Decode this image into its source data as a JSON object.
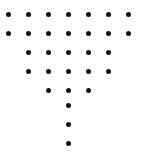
{
  "figure": {
    "background_color": "#ffffff",
    "dot_color": "#111111",
    "dot_diameter": 5,
    "width": 142,
    "height": 158
  },
  "grid": {
    "origin_x": 8,
    "origin_y": 14,
    "column_spacing": 20,
    "row_spacing": 19,
    "columns": 7,
    "rows": 8
  },
  "chart_data": {
    "type": "scatter",
    "title": "",
    "xlabel": "",
    "ylabel": "",
    "grid": false,
    "legend": "none",
    "xlim": [
      0,
      142
    ],
    "ylim": [
      0,
      158
    ],
    "total_dots": 27,
    "row_counts": [
      7,
      7,
      5,
      5,
      3,
      1,
      1,
      1
    ],
    "rows": [
      {
        "row": 1,
        "y": 14,
        "count": 7,
        "columns": [
          0,
          1,
          2,
          3,
          4,
          5,
          6
        ],
        "x": [
          8,
          28,
          48,
          68,
          88,
          108,
          128
        ]
      },
      {
        "row": 2,
        "y": 33,
        "count": 7,
        "columns": [
          0,
          1,
          2,
          3,
          4,
          5,
          6
        ],
        "x": [
          8,
          28,
          48,
          68,
          88,
          108,
          128
        ]
      },
      {
        "row": 3,
        "y": 52,
        "count": 5,
        "columns": [
          1,
          2,
          3,
          4,
          5
        ],
        "x": [
          28,
          48,
          68,
          88,
          108
        ]
      },
      {
        "row": 4,
        "y": 71,
        "count": 5,
        "columns": [
          1,
          2,
          3,
          4,
          5
        ],
        "x": [
          28,
          48,
          68,
          88,
          108
        ]
      },
      {
        "row": 5,
        "y": 90,
        "count": 3,
        "columns": [
          2,
          3,
          4
        ],
        "x": [
          48,
          68,
          88
        ]
      },
      {
        "row": 6,
        "y": 105,
        "count": 1,
        "columns": [
          3
        ],
        "x": [
          68
        ]
      },
      {
        "row": 7,
        "y": 124,
        "count": 1,
        "columns": [
          3
        ],
        "x": [
          68
        ]
      },
      {
        "row": 8,
        "y": 143,
        "count": 1,
        "columns": [
          3
        ],
        "x": [
          68
        ]
      }
    ]
  }
}
